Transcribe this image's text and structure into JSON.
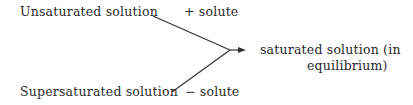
{
  "diagram": {
    "inputs": [
      {
        "label": "Unsaturated solution",
        "operation": "+ solute"
      },
      {
        "label": "Supersaturated solution",
        "operation": "− solute"
      }
    ],
    "output": {
      "line1": "saturated solution (in",
      "line2": "equilibrium)"
    }
  }
}
